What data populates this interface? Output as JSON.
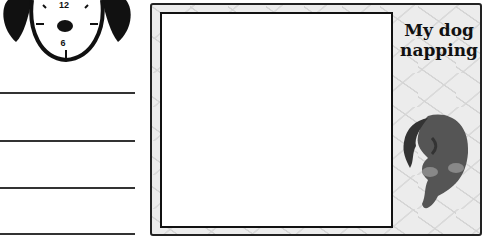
{
  "clock": {
    "top_number": "12",
    "bottom_number": "6",
    "icon": "dog-clock-icon"
  },
  "writing_lines": {
    "count": 4
  },
  "photo_frame": {
    "caption_line1": "My dog",
    "caption_line2": "napping",
    "illustration": "sleeping-dog-icon"
  },
  "colors": {
    "ink": "#111111",
    "frame_fill": "#ececec",
    "paper": "#ffffff"
  }
}
